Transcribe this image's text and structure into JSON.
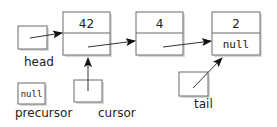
{
  "diagram": {
    "type": "linked-list",
    "nodes": [
      {
        "id": "node-1",
        "data": "42",
        "link": ""
      },
      {
        "id": "node-2",
        "data": "4",
        "link": ""
      },
      {
        "id": "node-3",
        "data": "2",
        "link": "null"
      }
    ],
    "pointers": [
      {
        "id": "head",
        "label": "head",
        "value": "",
        "points_to": "node-1"
      },
      {
        "id": "cursor",
        "label": "cursor",
        "value": "",
        "points_to": "node-1"
      },
      {
        "id": "precursor",
        "label": "precursor",
        "value": "null",
        "points_to": null
      },
      {
        "id": "tail",
        "label": "tail",
        "value": "",
        "points_to": "node-3"
      }
    ]
  }
}
